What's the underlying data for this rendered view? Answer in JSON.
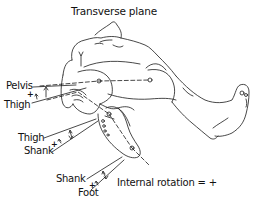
{
  "title": "Transverse plane",
  "labels": {
    "pelvis": "Pelvis",
    "thigh_1": "Thigh",
    "thigh_2": "Thigh",
    "shank_1": "Shank",
    "shank_2": "Shank",
    "foot": "Foot"
  },
  "signs": {
    "pelvis_thigh": "+",
    "thigh_shank": "+",
    "shank_foot": "+"
  },
  "convention": "Internal rotation = +",
  "angles": [
    {
      "proximal": "Pelvis",
      "distal": "Thigh"
    },
    {
      "proximal": "Thigh",
      "distal": "Shank"
    },
    {
      "proximal": "Shank",
      "distal": "Foot"
    }
  ],
  "colors": {
    "line": "#1a1a1a",
    "background": "#ffffff"
  }
}
